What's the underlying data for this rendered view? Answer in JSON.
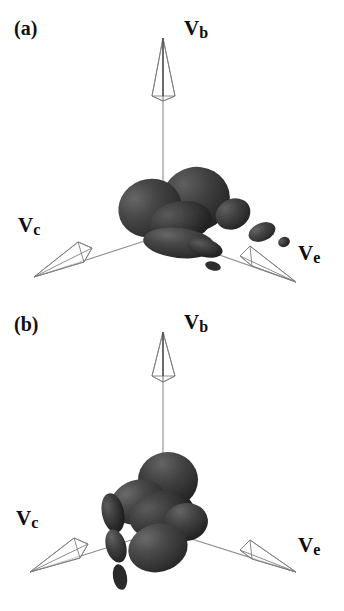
{
  "figure": {
    "background_color": "#ffffff",
    "lobe_color": "#3f3f3f",
    "lobe_color_light": "#5c5c5c",
    "lobe_color_dark": "#262626",
    "axis_color": "#8d8d8d",
    "text_color": "#0c0c0c"
  },
  "panels": [
    {
      "id": "a",
      "label": "(a)",
      "axes": [
        {
          "name": "Vb",
          "symbol": "V",
          "subscript": "b"
        },
        {
          "name": "Vc",
          "symbol": "V",
          "subscript": "c"
        },
        {
          "name": "Ve",
          "symbol": "V",
          "subscript": "e"
        }
      ]
    },
    {
      "id": "b",
      "label": "(b)",
      "axes": [
        {
          "name": "Vb",
          "symbol": "V",
          "subscript": "b"
        },
        {
          "name": "Vc",
          "symbol": "V",
          "subscript": "c"
        },
        {
          "name": "Ve",
          "symbol": "V",
          "subscript": "e"
        }
      ]
    }
  ],
  "labels": {
    "panel_a": "(a)",
    "panel_b": "(b)",
    "vb_symbol": "V",
    "vb_sub": "b",
    "vc_symbol": "V",
    "vc_sub": "c",
    "ve_symbol": "V",
    "ve_sub": "e"
  }
}
